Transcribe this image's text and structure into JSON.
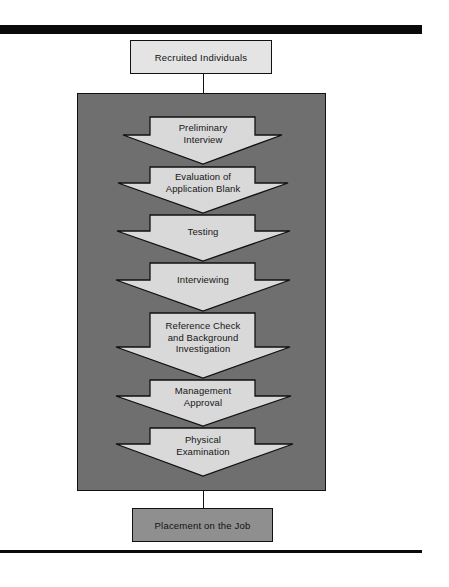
{
  "diagram": {
    "start": {
      "label": "Recruited Individuals"
    },
    "steps": [
      {
        "label_lines": [
          "Preliminary",
          "Interview"
        ]
      },
      {
        "label_lines": [
          "Evaluation of",
          "Application Blank"
        ]
      },
      {
        "label_lines": [
          "Testing"
        ]
      },
      {
        "label_lines": [
          "Interviewing"
        ]
      },
      {
        "label_lines": [
          "Reference Check",
          "and Background",
          "Investigation"
        ]
      },
      {
        "label_lines": [
          "Management",
          "Approval"
        ]
      },
      {
        "label_lines": [
          "Physical",
          "Examination"
        ]
      }
    ],
    "end": {
      "label": "Placement on the Job"
    }
  },
  "colors": {
    "panel": "#6f6f6f",
    "arrow_fill": "#d9d9d9",
    "start_box": "#e4e4e4",
    "end_box": "#8f8f8f",
    "rule": "#0a0a0a"
  }
}
